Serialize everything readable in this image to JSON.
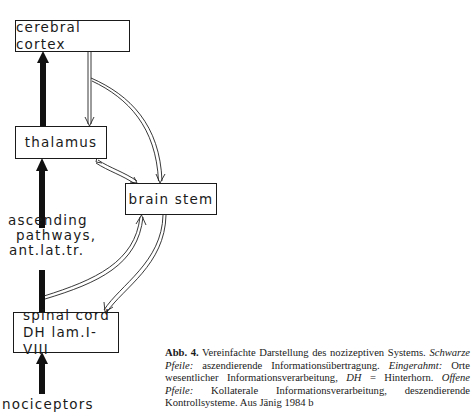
{
  "diagram": {
    "nodes": {
      "cortex": {
        "label": "cerebral cortex"
      },
      "thalamus": {
        "label": "thalamus"
      },
      "brainstem": {
        "label": "brain stem"
      },
      "spinal": {
        "line1": "spinal cord",
        "line2": "DH lam.I-VIII"
      }
    },
    "labels": {
      "pathways_line1": "ascending",
      "pathways_line2": "pathways,",
      "pathways_line3": "ant.lat.tr.",
      "nociceptors": "nociceptors"
    },
    "edges": [
      {
        "from": "nociceptors",
        "to": "spinal cord",
        "style": "solid-black"
      },
      {
        "from": "spinal cord",
        "to": "thalamus",
        "style": "solid-black"
      },
      {
        "from": "thalamus",
        "to": "cerebral cortex",
        "style": "solid-black"
      },
      {
        "from": "cerebral cortex",
        "to": "thalamus",
        "style": "open-double"
      },
      {
        "from": "cerebral cortex",
        "to": "brain stem",
        "style": "open-double"
      },
      {
        "from": "thalamus",
        "to": "brain stem",
        "style": "open-double-bidirectional"
      },
      {
        "from": "spinal cord",
        "to": "brain stem",
        "style": "open-double"
      },
      {
        "from": "brain stem",
        "to": "spinal cord",
        "style": "open-double"
      }
    ]
  },
  "caption": {
    "label": "Abb. 4.",
    "s1": " Vereinfachte Darstellung des nozizeptiven Systems. ",
    "i1": "Schwarze Pfeile:",
    "s2": " aszendierende Informationsübertragung. ",
    "i2": "Eingerahmt:",
    "s3": " Orte wesentlicher Informationsverarbeitung, ",
    "i3": "DH",
    "s4": " = Hinterhorn. ",
    "i4": "Offene Pfeile:",
    "s5": " Kollaterale Informationsverarbeitung, deszendierende Kontrollsysteme. Aus Jänig 1984 b"
  }
}
